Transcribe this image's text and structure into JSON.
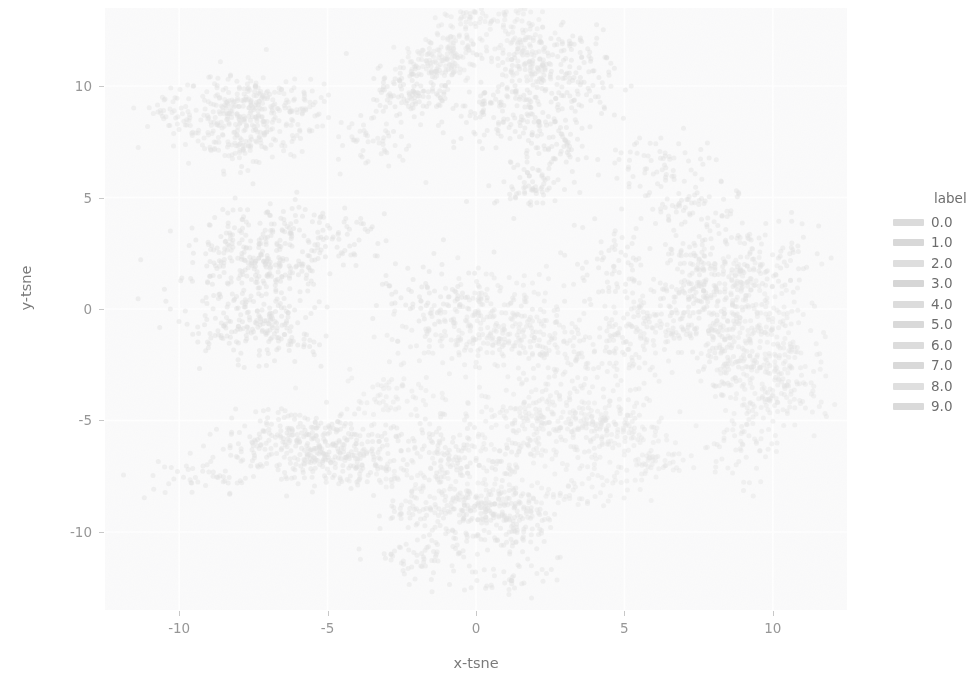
{
  "chart_data": {
    "type": "scatter",
    "title": "",
    "xlabel": "x-tsne",
    "ylabel": "y-tsne",
    "xlim": [
      -12.5,
      12.5
    ],
    "ylim": [
      -13.5,
      13.5
    ],
    "xticks": [
      "-10",
      "-5",
      "0",
      "5",
      "10"
    ],
    "xtick_values": [
      -10,
      -5,
      0,
      5,
      10
    ],
    "yticks": [
      "10",
      "5",
      "0",
      "-5",
      "-10"
    ],
    "ytick_values": [
      10,
      5,
      0,
      -5,
      -10
    ],
    "grid": true,
    "grid_color": "#ffffff",
    "panel_background": "#f4f4f5",
    "legend_position": "right",
    "legend_title": "label",
    "appearance": "faded, low-contrast, desaturated grayscale print scan",
    "series": [
      {
        "name": "0.0",
        "color": "#bdbdbd",
        "cluster_center": [
          -6.5,
          8.6
        ],
        "spread": [
          2.6,
          1.8
        ],
        "n": 480
      },
      {
        "name": "1.0",
        "color": "#b8b8b8",
        "cluster_center": [
          1.6,
          9.1
        ],
        "spread": [
          2.2,
          2.0
        ],
        "n": 560
      },
      {
        "name": "2.0",
        "color": "#c2c2c2",
        "cluster_center": [
          -0.3,
          11.6
        ],
        "spread": [
          1.6,
          1.2
        ],
        "n": 300
      },
      {
        "name": "3.0",
        "color": "#b5b5b5",
        "cluster_center": [
          -6.2,
          1.6
        ],
        "spread": [
          3.2,
          2.2
        ],
        "n": 620
      },
      {
        "name": "4.0",
        "color": "#bfbfbf",
        "cluster_center": [
          0.8,
          -0.6
        ],
        "spread": [
          3.4,
          2.4
        ],
        "n": 640
      },
      {
        "name": "5.0",
        "color": "#bababa",
        "cluster_center": [
          7.0,
          2.4
        ],
        "spread": [
          2.4,
          2.6
        ],
        "n": 520
      },
      {
        "name": "6.0",
        "color": "#c0c0c0",
        "cluster_center": [
          9.6,
          -1.6
        ],
        "spread": [
          2.0,
          3.0
        ],
        "n": 470
      },
      {
        "name": "7.0",
        "color": "#b9b9b9",
        "cluster_center": [
          -4.8,
          -6.4
        ],
        "spread": [
          3.0,
          1.6
        ],
        "n": 560
      },
      {
        "name": "8.0",
        "color": "#c4c4c4",
        "cluster_center": [
          2.6,
          -6.2
        ],
        "spread": [
          3.2,
          1.7
        ],
        "n": 540
      },
      {
        "name": "9.0",
        "color": "#bcbcbc",
        "cluster_center": [
          -0.2,
          -10.2
        ],
        "spread": [
          2.4,
          1.3
        ],
        "n": 380
      }
    ],
    "legend_entries": [
      {
        "label": "0.0",
        "color": "#bdbdbd"
      },
      {
        "label": "1.0",
        "color": "#b8b8b8"
      },
      {
        "label": "2.0",
        "color": "#c2c2c2"
      },
      {
        "label": "3.0",
        "color": "#b5b5b5"
      },
      {
        "label": "4.0",
        "color": "#bfbfbf"
      },
      {
        "label": "5.0",
        "color": "#bababa"
      },
      {
        "label": "6.0",
        "color": "#c0c0c0"
      },
      {
        "label": "7.0",
        "color": "#b9b9b9"
      },
      {
        "label": "8.0",
        "color": "#c4c4c4"
      },
      {
        "label": "9.0",
        "color": "#bcbcbc"
      }
    ]
  }
}
